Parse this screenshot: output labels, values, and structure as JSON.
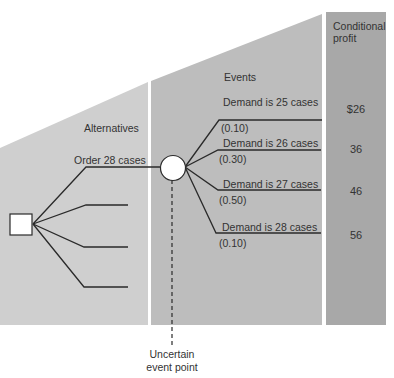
{
  "diagram": {
    "type": "decision-tree",
    "colors": {
      "alternatives_panel": "#cfcfcf",
      "events_panel": "#bdbdbd",
      "profit_column": "#a8a8a8",
      "line": "#2a2a2a",
      "node_fill": "#ffffff"
    },
    "headers": {
      "alternatives": "Alternatives",
      "events": "Events",
      "conditional_profit_line1": "Conditional",
      "conditional_profit_line2": "profit"
    },
    "decision_node": {
      "shape": "square"
    },
    "alternatives": [
      {
        "label": "Order 28 cases"
      },
      {
        "label": ""
      },
      {
        "label": ""
      },
      {
        "label": ""
      }
    ],
    "event_node": {
      "shape": "circle",
      "annotation_line1": "Uncertain",
      "annotation_line2": "event point"
    },
    "events": [
      {
        "label": "Demand is 25 cases",
        "probability": "(0.10)",
        "profit": "$26"
      },
      {
        "label": "Demand is 26 cases",
        "probability": "(0.30)",
        "profit": "36"
      },
      {
        "label": "Demand is 27 cases",
        "probability": "(0.50)",
        "profit": "46"
      },
      {
        "label": "Demand is 28 cases",
        "probability": "(0.10)",
        "profit": "56"
      }
    ]
  }
}
